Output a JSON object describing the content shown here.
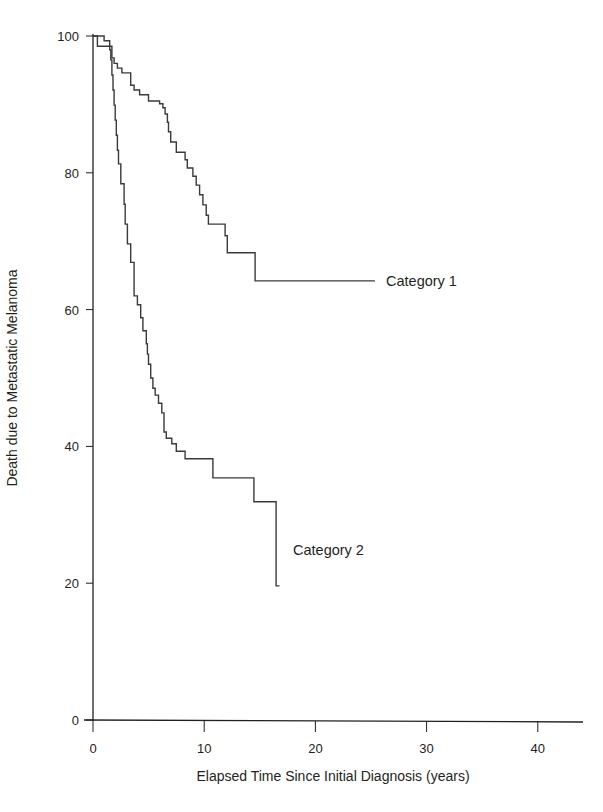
{
  "chart_data": {
    "type": "line",
    "subtype": "kaplan-meier-step",
    "title": "",
    "xlabel": "Elapsed Time Since Initial Diagnosis (years)",
    "ylabel": "Death due to Metastatic Melanoma",
    "xlim": [
      0,
      43
    ],
    "ylim": [
      0,
      100
    ],
    "x_ticks": [
      0,
      10,
      20,
      30,
      40
    ],
    "y_ticks": [
      0,
      20,
      40,
      60,
      80,
      100
    ],
    "grid": false,
    "legend": "inline-labels",
    "series": [
      {
        "name": "Category 1",
        "label_position": {
          "x": 26.4,
          "y": 64
        },
        "points": [
          [
            0,
            100
          ],
          [
            1.0,
            100
          ],
          [
            1.0,
            99.3
          ],
          [
            1.5,
            99.3
          ],
          [
            1.5,
            98.5
          ],
          [
            1.7,
            98.5
          ],
          [
            1.7,
            96.8
          ],
          [
            1.9,
            96.8
          ],
          [
            1.9,
            96.0
          ],
          [
            2.2,
            96.0
          ],
          [
            2.2,
            95.3
          ],
          [
            2.6,
            95.3
          ],
          [
            2.6,
            94.6
          ],
          [
            3.4,
            94.6
          ],
          [
            3.4,
            92.8
          ],
          [
            3.7,
            92.8
          ],
          [
            3.7,
            92.1
          ],
          [
            4.2,
            92.1
          ],
          [
            4.2,
            91.4
          ],
          [
            5.0,
            91.4
          ],
          [
            5.0,
            90.5
          ],
          [
            6.0,
            90.5
          ],
          [
            6.0,
            90.1
          ],
          [
            6.3,
            90.1
          ],
          [
            6.3,
            89.5
          ],
          [
            6.5,
            89.5
          ],
          [
            6.5,
            88.6
          ],
          [
            6.7,
            88.6
          ],
          [
            6.7,
            87.4
          ],
          [
            6.8,
            87.4
          ],
          [
            6.8,
            86.0
          ],
          [
            7.0,
            86.0
          ],
          [
            7.0,
            84.5
          ],
          [
            7.5,
            84.5
          ],
          [
            7.5,
            83.0
          ],
          [
            8.3,
            83.0
          ],
          [
            8.3,
            81.9
          ],
          [
            8.5,
            81.9
          ],
          [
            8.5,
            80.7
          ],
          [
            9.0,
            80.7
          ],
          [
            9.0,
            79.5
          ],
          [
            9.3,
            79.5
          ],
          [
            9.3,
            78.2
          ],
          [
            9.6,
            78.2
          ],
          [
            9.6,
            76.8
          ],
          [
            9.9,
            76.8
          ],
          [
            9.9,
            75.3
          ],
          [
            10.2,
            75.3
          ],
          [
            10.2,
            73.8
          ],
          [
            10.4,
            73.8
          ],
          [
            10.4,
            72.5
          ],
          [
            11.9,
            72.5
          ],
          [
            11.9,
            70.8
          ],
          [
            12.1,
            70.8
          ],
          [
            12.1,
            68.3
          ],
          [
            14.6,
            68.3
          ],
          [
            14.6,
            64.2
          ],
          [
            25.4,
            64.2
          ]
        ]
      },
      {
        "name": "Category 2",
        "label_position": {
          "x": 18.0,
          "y": 24.5
        },
        "points": [
          [
            0,
            100
          ],
          [
            0.4,
            100
          ],
          [
            0.4,
            98.5
          ],
          [
            1.5,
            98.5
          ],
          [
            1.5,
            98.0
          ],
          [
            1.6,
            98.0
          ],
          [
            1.6,
            96.5
          ],
          [
            1.7,
            96.5
          ],
          [
            1.7,
            94.3
          ],
          [
            1.8,
            94.3
          ],
          [
            1.8,
            92.1
          ],
          [
            1.9,
            92.1
          ],
          [
            1.9,
            89.9
          ],
          [
            2.0,
            89.9
          ],
          [
            2.0,
            87.7
          ],
          [
            2.1,
            87.7
          ],
          [
            2.1,
            85.5
          ],
          [
            2.2,
            85.5
          ],
          [
            2.2,
            83.3
          ],
          [
            2.3,
            83.3
          ],
          [
            2.3,
            81.3
          ],
          [
            2.5,
            81.3
          ],
          [
            2.5,
            78.4
          ],
          [
            2.8,
            78.4
          ],
          [
            2.8,
            75.4
          ],
          [
            2.9,
            75.4
          ],
          [
            2.9,
            72.5
          ],
          [
            3.1,
            72.5
          ],
          [
            3.1,
            69.6
          ],
          [
            3.4,
            69.6
          ],
          [
            3.4,
            66.9
          ],
          [
            3.7,
            66.9
          ],
          [
            3.7,
            62.0
          ],
          [
            4.0,
            62.0
          ],
          [
            4.0,
            60.7
          ],
          [
            4.3,
            60.7
          ],
          [
            4.3,
            58.8
          ],
          [
            4.5,
            58.8
          ],
          [
            4.5,
            56.9
          ],
          [
            4.8,
            56.9
          ],
          [
            4.8,
            55.0
          ],
          [
            4.9,
            55.0
          ],
          [
            4.9,
            53.5
          ],
          [
            5.0,
            53.5
          ],
          [
            5.0,
            52.0
          ],
          [
            5.2,
            52.0
          ],
          [
            5.2,
            50.0
          ],
          [
            5.4,
            50.0
          ],
          [
            5.4,
            48.5
          ],
          [
            5.6,
            48.5
          ],
          [
            5.6,
            47.5
          ],
          [
            5.9,
            47.5
          ],
          [
            5.9,
            46.3
          ],
          [
            6.2,
            46.3
          ],
          [
            6.2,
            44.9
          ],
          [
            6.4,
            44.9
          ],
          [
            6.4,
            42.1
          ],
          [
            6.6,
            42.1
          ],
          [
            6.6,
            41.2
          ],
          [
            7.1,
            41.2
          ],
          [
            7.1,
            40.4
          ],
          [
            7.5,
            40.4
          ],
          [
            7.5,
            39.3
          ],
          [
            8.3,
            39.3
          ],
          [
            8.3,
            38.2
          ],
          [
            10.8,
            38.2
          ],
          [
            10.8,
            35.4
          ],
          [
            14.5,
            35.4
          ],
          [
            14.5,
            31.9
          ],
          [
            16.5,
            31.9
          ],
          [
            16.5,
            19.6
          ],
          [
            16.8,
            19.6
          ]
        ]
      }
    ]
  },
  "labels": {
    "xlabel": "Elapsed Time Since Initial Diagnosis (years)",
    "ylabel": "Death due to Metastatic Melanoma",
    "series_1": "Category 1",
    "series_2": "Category 2"
  }
}
